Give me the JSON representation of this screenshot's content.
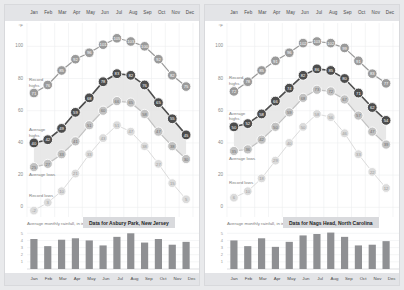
{
  "months": [
    "Jan",
    "Feb",
    "Mar",
    "Apr",
    "May",
    "Jun",
    "Jul",
    "Aug",
    "Sep",
    "Oct",
    "Nov",
    "Dec"
  ],
  "temp_axis": {
    "unit": "°F",
    "ticks": [
      100,
      80,
      60,
      40,
      20,
      0
    ],
    "min": -6,
    "max": 112
  },
  "rain_axis": {
    "ticks": [
      5,
      4,
      3,
      2,
      1
    ],
    "min": 0,
    "max": 5.6
  },
  "series_labels": {
    "record_highs": "Record\nhighs",
    "average_highs": "Average\nhighs",
    "average_lows": "Average lows",
    "record_lows": "Record lows"
  },
  "colors": {
    "record_high": "#9a9a9a",
    "average_high": "#4d4d4d",
    "average_low": "#c2c2c2",
    "record_low": "#dcdcdc",
    "band_fill": "#e4e4e4",
    "rain_bar": "#8f9093",
    "strip_bg": "#e3e4e7",
    "caption_bg": "#d9dadd",
    "page_bg": "#e9eaec",
    "panel_bg": "#ffffff",
    "grid": "#eceef0"
  },
  "panels": [
    {
      "id": "asbury-park",
      "caption": "Data for Asbury Park, New Jersey",
      "rain_title": "Average monthly rainfall, in inches",
      "chart_data": {
        "type": "line",
        "title": "Data for Asbury Park, New Jersey",
        "xlabel": "",
        "ylabel": "°F",
        "ylim": [
          -6,
          112
        ],
        "grid": true,
        "legend": "inline-annotations",
        "categories": [
          "Jan",
          "Feb",
          "Mar",
          "Apr",
          "May",
          "Jun",
          "Jul",
          "Aug",
          "Sep",
          "Oct",
          "Nov",
          "Dec"
        ],
        "series": [
          {
            "name": "Record highs",
            "values": [
              71,
              76,
              85,
              92,
              96,
              101,
              105,
              103,
              100,
              92,
              82,
              75
            ]
          },
          {
            "name": "Average highs",
            "values": [
              40,
              42,
              49,
              59,
              68,
              78,
              83,
              82,
              76,
              65,
              55,
              45
            ]
          },
          {
            "name": "Average lows",
            "values": [
              25,
              27,
              33,
              41,
              51,
              60,
              66,
              65,
              58,
              47,
              38,
              30
            ]
          },
          {
            "name": "Record lows",
            "values": [
              -2,
              3,
              10,
              21,
              33,
              43,
              51,
              47,
              38,
              27,
              15,
              5
            ]
          }
        ]
      },
      "rain_chart_data": {
        "type": "bar",
        "title": "Average monthly rainfall, in inches",
        "categories": [
          "Jan",
          "Feb",
          "Mar",
          "Apr",
          "May",
          "Jun",
          "Jul",
          "Aug",
          "Sep",
          "Oct",
          "Nov",
          "Dec"
        ],
        "values": [
          4.2,
          3.2,
          4.1,
          4.3,
          4.0,
          3.3,
          4.5,
          5.0,
          3.7,
          4.2,
          3.4,
          3.8
        ],
        "ylim": [
          0,
          5.6
        ],
        "ylabel": "inches"
      }
    },
    {
      "id": "nags-head",
      "caption": "Data for Nags Head, North Carolina",
      "rain_title": "Average monthly rainfall, in inches",
      "chart_data": {
        "type": "line",
        "title": "Data for Nags Head, North Carolina",
        "xlabel": "",
        "ylabel": "°F",
        "ylim": [
          -6,
          112
        ],
        "grid": true,
        "legend": "inline-annotations",
        "categories": [
          "Jan",
          "Feb",
          "Mar",
          "Apr",
          "May",
          "Jun",
          "Jul",
          "Aug",
          "Sep",
          "Oct",
          "Nov",
          "Dec"
        ],
        "series": [
          {
            "name": "Record highs",
            "values": [
              72,
              78,
              85,
              91,
              96,
              102,
              103,
              102,
              99,
              91,
              83,
              77
            ]
          },
          {
            "name": "Average highs",
            "values": [
              50,
              52,
              58,
              66,
              74,
              82,
              86,
              85,
              80,
              71,
              62,
              54
            ]
          },
          {
            "name": "Average lows",
            "values": [
              35,
              36,
              42,
              50,
              59,
              68,
              73,
              72,
              67,
              57,
              47,
              39
            ]
          },
          {
            "name": "Record lows",
            "values": [
              6,
              10,
              18,
              29,
              40,
              50,
              58,
              56,
              46,
              33,
              22,
              12
            ]
          }
        ]
      },
      "rain_chart_data": {
        "type": "bar",
        "title": "Average monthly rainfall, in inches",
        "categories": [
          "Jan",
          "Feb",
          "Mar",
          "Apr",
          "May",
          "Jun",
          "Jul",
          "Aug",
          "Sep",
          "Oct",
          "Nov",
          "Dec"
        ],
        "values": [
          4.0,
          3.2,
          4.3,
          3.1,
          3.8,
          4.7,
          4.9,
          5.1,
          4.5,
          3.3,
          3.4,
          3.9
        ],
        "ylim": [
          0,
          5.6
        ],
        "ylabel": "inches"
      }
    }
  ]
}
